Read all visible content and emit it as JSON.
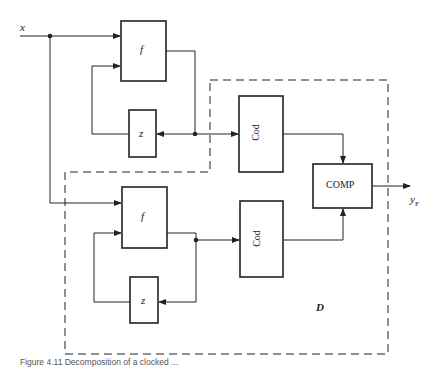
{
  "figure": {
    "input_label": "x",
    "output_label_main": "y",
    "output_label_sub": "F",
    "region_label": "D",
    "caption": "Figure 4.11 Decomposition of a clocked ..."
  },
  "blocks": {
    "f_top": "f",
    "z_top": "z",
    "cod_top": "Cod",
    "f_bottom": "f",
    "z_bottom": "z",
    "cod_bottom": "Cod",
    "comp": "COMP"
  },
  "colors": {
    "line": "#222222",
    "background": "#ffffff"
  }
}
